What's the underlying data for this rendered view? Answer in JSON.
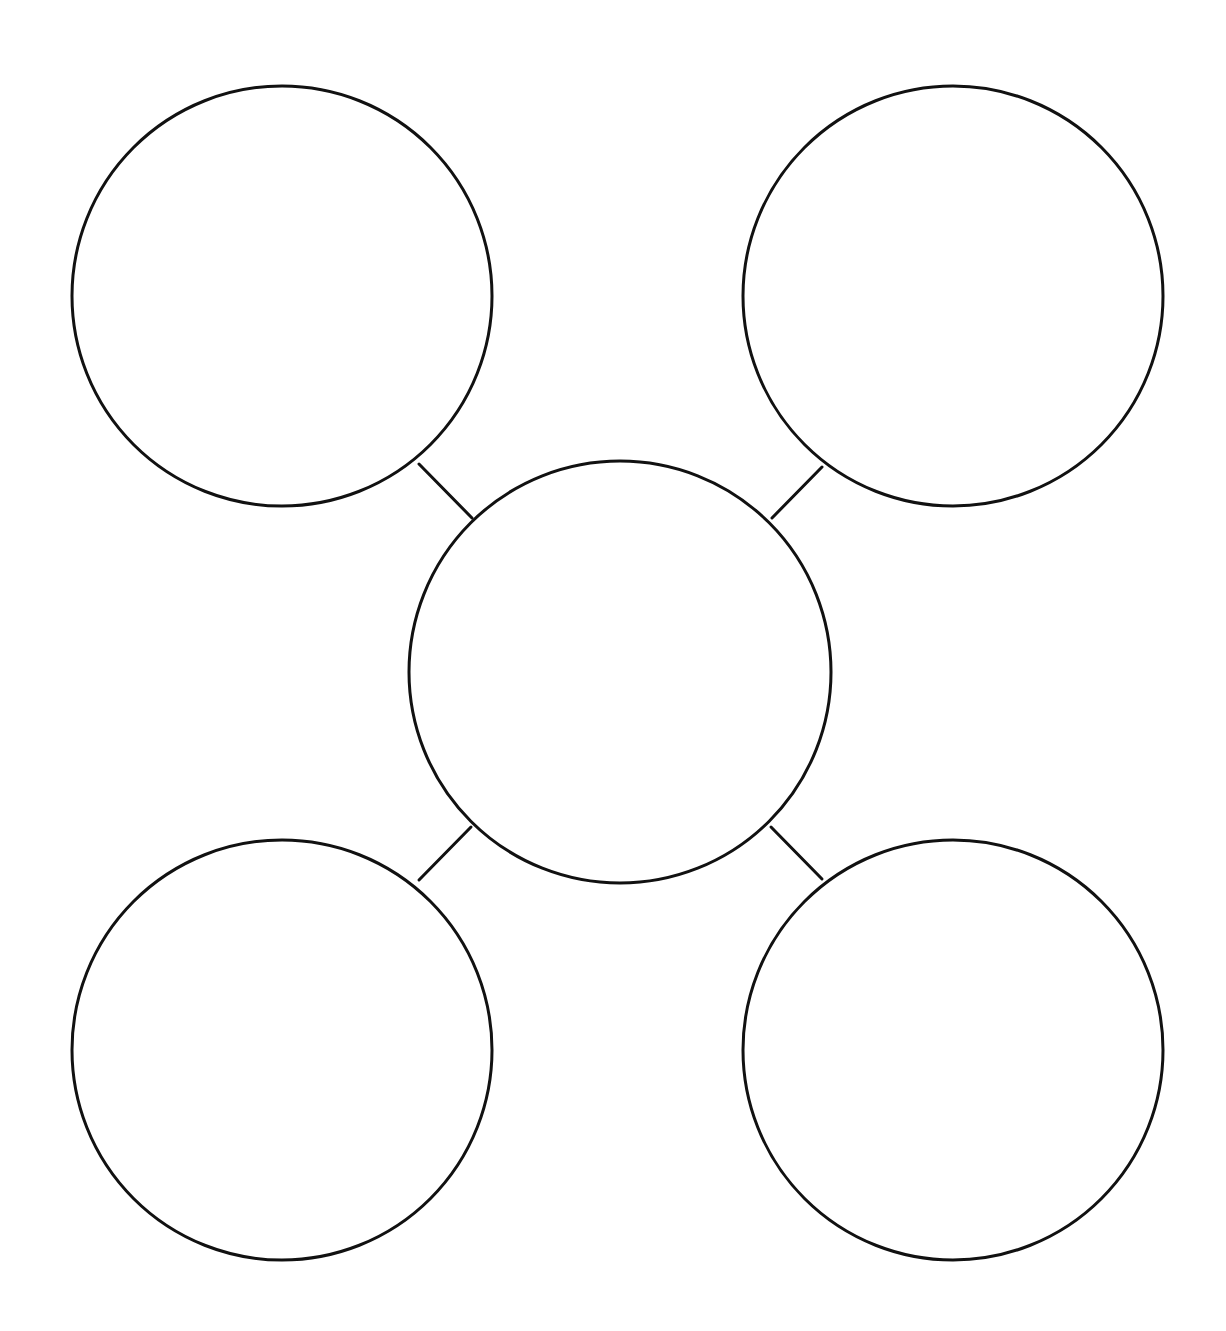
{
  "diagram": {
    "type": "bubble-map",
    "background": "#ffffff",
    "stroke_color": "#111111",
    "nodes": [
      {
        "id": "top-left",
        "cx": 282,
        "cy": 296,
        "r": 210,
        "label": ""
      },
      {
        "id": "top-right",
        "cx": 953,
        "cy": 296,
        "r": 210,
        "label": ""
      },
      {
        "id": "center",
        "cx": 620,
        "cy": 672,
        "r": 211,
        "label": ""
      },
      {
        "id": "bottom-left",
        "cx": 282,
        "cy": 1050,
        "r": 210,
        "label": ""
      },
      {
        "id": "bottom-right",
        "cx": 953,
        "cy": 1050,
        "r": 210,
        "label": ""
      }
    ],
    "edges": [
      {
        "from": "top-left",
        "to": "center",
        "x1": 419,
        "y1": 464,
        "x2": 472,
        "y2": 518
      },
      {
        "from": "top-right",
        "to": "center",
        "x1": 822,
        "y1": 467,
        "x2": 772,
        "y2": 518
      },
      {
        "from": "bottom-left",
        "to": "center",
        "x1": 419,
        "y1": 880,
        "x2": 471,
        "y2": 827
      },
      {
        "from": "bottom-right",
        "to": "center",
        "x1": 822,
        "y1": 879,
        "x2": 771,
        "y2": 827
      }
    ]
  }
}
